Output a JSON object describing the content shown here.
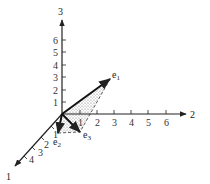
{
  "diagram": {
    "type": "3d-coordinate-axes-with-basis-vectors",
    "axes": [
      {
        "name": "1",
        "label": "1",
        "ticks": [
          "1",
          "2",
          "3",
          "4"
        ]
      },
      {
        "name": "2",
        "label": "2",
        "ticks": [
          "1",
          "2",
          "3",
          "4",
          "5",
          "6"
        ]
      },
      {
        "name": "3",
        "label": "3",
        "ticks": [
          "1",
          "2",
          "3",
          "4",
          "5",
          "6"
        ]
      }
    ],
    "vectors": [
      {
        "name": "e1",
        "label": "e",
        "subscript": "1"
      },
      {
        "name": "e2",
        "label": "e",
        "subscript": "2"
      },
      {
        "name": "e3",
        "label": "e",
        "subscript": "3"
      }
    ],
    "shaded_region": "dotted-stipple triangle spanned by e1, e2, e3",
    "colors": {
      "ink": "#222222",
      "shade": "#c8c8c8",
      "background": "#ffffff"
    }
  }
}
